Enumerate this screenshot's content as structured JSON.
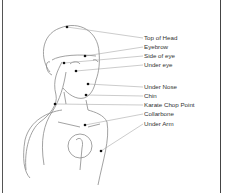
{
  "diagram": {
    "points": [
      {
        "label": "Top of Head",
        "dot": [
          67,
          27
        ],
        "label_y": 38
      },
      {
        "label": "Eyebrow",
        "dot": [
          85,
          56
        ],
        "label_y": 47
      },
      {
        "label": "Side of eye",
        "dot": [
          64,
          63
        ],
        "label_y": 56
      },
      {
        "label": "Under eye",
        "dot": [
          76,
          71
        ],
        "label_y": 65
      },
      {
        "label": "Under Nose",
        "dot": [
          88,
          84
        ],
        "label_y": 87
      },
      {
        "label": "Chin",
        "dot": [
          86,
          95
        ],
        "label_y": 96
      },
      {
        "label": "Karate Chop Point",
        "dot": [
          55,
          104
        ],
        "label_y": 105
      },
      {
        "label": "Collarbone",
        "dot": [
          85,
          125
        ],
        "label_y": 114
      },
      {
        "label": "Under Arm",
        "dot": [
          101,
          151
        ],
        "label_y": 124
      }
    ],
    "colors": {
      "line": "#777777",
      "dot": "#111111",
      "text": "#333333",
      "border": "#444444"
    }
  }
}
